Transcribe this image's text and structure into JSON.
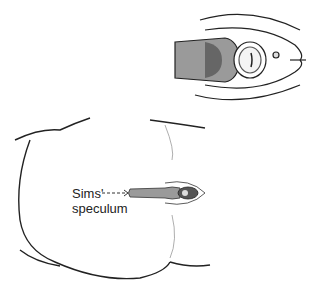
{
  "figure": {
    "label_line1": "Sims'",
    "label_line2": "speculum",
    "colors": {
      "line": "#222222",
      "speculum_fill": "#9a9a9a",
      "speculum_dark": "#555555"
    }
  }
}
